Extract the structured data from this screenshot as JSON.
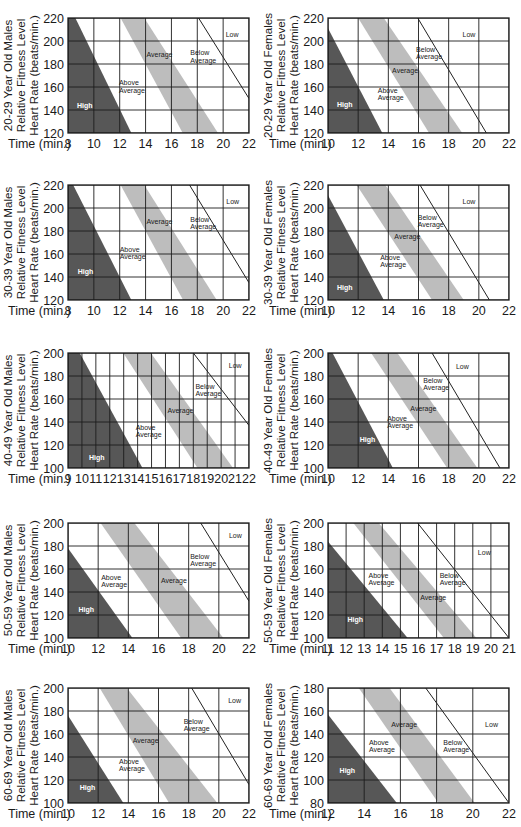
{
  "colors": {
    "high": "#575757",
    "average_band": "#bdbdbd",
    "grid": "#1c1c1c",
    "low_line": "#222222",
    "text": "#1a1a1a",
    "high_label": "#ffffff",
    "background": "#ffffff"
  },
  "chart_data": [
    {
      "id": "20-29-males",
      "type": "area",
      "title_lines": [
        "20-29 Year Old Males",
        "Relative Fitness Level",
        "Heart Rate (beats/min.)"
      ],
      "xlabel": "Time (min.)",
      "ylabel": "Heart Rate (beats/min.)",
      "xlim": [
        8,
        22
      ],
      "ylim": [
        120,
        220
      ],
      "x_ticks": [
        8,
        10,
        12,
        14,
        16,
        18,
        20,
        22
      ],
      "y_ticks": [
        120,
        140,
        160,
        180,
        200,
        220
      ],
      "grid": true,
      "high_region": [
        [
          8,
          220
        ],
        [
          8.57,
          220
        ],
        [
          12.9,
          120
        ],
        [
          8,
          120
        ]
      ],
      "average_band": [
        [
          12.07,
          220
        ],
        [
          13.9,
          220
        ],
        [
          19.6,
          120
        ],
        [
          16.87,
          120
        ]
      ],
      "low_line": [
        [
          18.1,
          220
        ],
        [
          22,
          150
        ]
      ],
      "labels": [
        {
          "lines": [
            "Low"
          ],
          "x": 20.2,
          "y": 206
        },
        {
          "lines": [
            "Below",
            "Average"
          ],
          "x": 17.46,
          "y": 189.6
        },
        {
          "lines": [
            "Average"
          ],
          "x": 14.07,
          "y": 188
        },
        {
          "lines": [
            "Above",
            "Average"
          ],
          "x": 11.94,
          "y": 163.5
        },
        {
          "lines": [
            "High"
          ],
          "x": 8.7,
          "y": 144,
          "on_dark": true
        }
      ]
    },
    {
      "id": "20-29-females",
      "type": "area",
      "title_lines": [
        "20-29 Year Old Females",
        "Relative Fitness Level",
        "Heart Rate (beats/min.)"
      ],
      "xlabel": "Time (min.)",
      "ylabel": "Heart Rate (beats/min.)",
      "xlim": [
        10,
        22
      ],
      "ylim": [
        120,
        220
      ],
      "x_ticks": [
        10,
        12,
        14,
        16,
        18,
        20,
        22
      ],
      "y_ticks": [
        120,
        140,
        160,
        180,
        200,
        220
      ],
      "grid": true,
      "high_region": [
        [
          10,
          211
        ],
        [
          13.6,
          120
        ],
        [
          10,
          120
        ]
      ],
      "average_band": [
        [
          12.0,
          220
        ],
        [
          13.7,
          220
        ],
        [
          18.9,
          120
        ],
        [
          16.7,
          120
        ]
      ],
      "low_line": [
        [
          15.95,
          220
        ],
        [
          20.5,
          120
        ]
      ],
      "labels": [
        {
          "lines": [
            "Low"
          ],
          "x": 18.92,
          "y": 206
        },
        {
          "lines": [
            "Below",
            "Average"
          ],
          "x": 15.84,
          "y": 192.5
        },
        {
          "lines": [
            "Average"
          ],
          "x": 14.25,
          "y": 174.5
        },
        {
          "lines": [
            "Above",
            "Average"
          ],
          "x": 13.3,
          "y": 157
        },
        {
          "lines": [
            "High"
          ],
          "x": 10.6,
          "y": 144.6,
          "on_dark": true
        }
      ]
    },
    {
      "id": "30-39-males",
      "type": "area",
      "title_lines": [
        "30-39 Year Old Males",
        "Relative Fitness Level",
        "Heart Rate (beats/min.)"
      ],
      "xlabel": "Time (min.)",
      "ylabel": "Heart Rate (beats/min.)",
      "xlim": [
        8,
        22
      ],
      "ylim": [
        120,
        220
      ],
      "x_ticks": [
        8,
        10,
        12,
        14,
        16,
        18,
        20,
        22
      ],
      "y_ticks": [
        120,
        140,
        160,
        180,
        200,
        220
      ],
      "grid": true,
      "high_region": [
        [
          8,
          220
        ],
        [
          8.4,
          220
        ],
        [
          12.9,
          120
        ],
        [
          8,
          120
        ]
      ],
      "average_band": [
        [
          12.07,
          220
        ],
        [
          13.9,
          220
        ],
        [
          19.5,
          120
        ],
        [
          16.9,
          120
        ]
      ],
      "low_line": [
        [
          17.4,
          220
        ],
        [
          22,
          135
        ]
      ],
      "labels": [
        {
          "lines": [
            "Low"
          ],
          "x": 20.24,
          "y": 206
        },
        {
          "lines": [
            "Below",
            "Average"
          ],
          "x": 17.46,
          "y": 190.4
        },
        {
          "lines": [
            "Average"
          ],
          "x": 14.07,
          "y": 188.4
        },
        {
          "lines": [
            "Above",
            "Average"
          ],
          "x": 12.0,
          "y": 164
        },
        {
          "lines": [
            "High"
          ],
          "x": 8.75,
          "y": 145,
          "on_dark": true
        }
      ]
    },
    {
      "id": "30-39-females",
      "type": "area",
      "title_lines": [
        "30-39 Year Old Females",
        "Relative Fitness Level",
        "Heart Rate (beats/min.)"
      ],
      "xlabel": "Time (min.)",
      "ylabel": "Heart Rate (beats/min.)",
      "xlim": [
        10,
        22
      ],
      "ylim": [
        120,
        220
      ],
      "x_ticks": [
        10,
        12,
        14,
        16,
        18,
        20,
        22
      ],
      "y_ticks": [
        120,
        140,
        160,
        180,
        200,
        220
      ],
      "grid": true,
      "high_region": [
        [
          10,
          211
        ],
        [
          13.7,
          120
        ],
        [
          10,
          120
        ]
      ],
      "average_band": [
        [
          11.9,
          220
        ],
        [
          13.8,
          220
        ],
        [
          19.0,
          120
        ],
        [
          16.9,
          120
        ]
      ],
      "low_line": [
        [
          16.1,
          220
        ],
        [
          20.7,
          120
        ]
      ],
      "labels": [
        {
          "lines": [
            "Low"
          ],
          "x": 18.92,
          "y": 206
        },
        {
          "lines": [
            "Below",
            "Average"
          ],
          "x": 15.95,
          "y": 191.6
        },
        {
          "lines": [
            "Average"
          ],
          "x": 14.4,
          "y": 175.6
        },
        {
          "lines": [
            "Above",
            "Average"
          ],
          "x": 13.46,
          "y": 157
        },
        {
          "lines": [
            "High"
          ],
          "x": 10.6,
          "y": 130.7,
          "on_dark": true
        }
      ]
    },
    {
      "id": "40-49-males",
      "type": "area",
      "title_lines": [
        "40-49 Year Old Males",
        "Relative Fitness Level",
        "Heart Rate (beats/min.)"
      ],
      "xlabel": "Time (min.)",
      "ylabel": "Heart Rate (beats/min.)",
      "xlim": [
        9,
        22
      ],
      "ylim": [
        100,
        200
      ],
      "x_ticks": [
        9,
        10,
        11,
        12,
        13,
        14,
        15,
        16,
        17,
        18,
        19,
        20,
        21,
        22
      ],
      "y_ticks": [
        100,
        120,
        140,
        160,
        180,
        200
      ],
      "grid": true,
      "high_region": [
        [
          9,
          200
        ],
        [
          9.84,
          200
        ],
        [
          14.35,
          100
        ],
        [
          9,
          100
        ]
      ],
      "average_band": [
        [
          12.97,
          200
        ],
        [
          14.95,
          200
        ],
        [
          20.85,
          100
        ],
        [
          18.3,
          100
        ]
      ],
      "low_line": [
        [
          18.0,
          200
        ],
        [
          22,
          137
        ]
      ],
      "labels": [
        {
          "lines": [
            "Low"
          ],
          "x": 20.55,
          "y": 189
        },
        {
          "lines": [
            "Below",
            "Average"
          ],
          "x": 18.15,
          "y": 170.8
        },
        {
          "lines": [
            "Average"
          ],
          "x": 16.15,
          "y": 150.4
        },
        {
          "lines": [
            "Above",
            "Average"
          ],
          "x": 13.86,
          "y": 135
        },
        {
          "lines": [
            "High"
          ],
          "x": 10.5,
          "y": 108.7,
          "on_dark": true
        }
      ]
    },
    {
      "id": "40-49-females",
      "type": "area",
      "title_lines": [
        "40-49 Year Old Females",
        "Relative Fitness Level",
        "Heart Rate (beats/min.)"
      ],
      "xlabel": "Time (min.)",
      "ylabel": "Heart Rate (beats/min.)",
      "xlim": [
        10,
        22
      ],
      "ylim": [
        100,
        200
      ],
      "x_ticks": [
        10,
        12,
        14,
        16,
        18,
        20,
        22
      ],
      "y_ticks": [
        100,
        120,
        140,
        160,
        180,
        200
      ],
      "grid": true,
      "high_region": [
        [
          10,
          200
        ],
        [
          10.3,
          200
        ],
        [
          14.3,
          100
        ],
        [
          10,
          100
        ]
      ],
      "average_band": [
        [
          12.86,
          200
        ],
        [
          14.6,
          200
        ],
        [
          19.9,
          100
        ],
        [
          17.9,
          100
        ]
      ],
      "low_line": [
        [
          16.9,
          200
        ],
        [
          21.4,
          100
        ]
      ],
      "labels": [
        {
          "lines": [
            "Low"
          ],
          "x": 18.48,
          "y": 188
        },
        {
          "lines": [
            "Below",
            "Average"
          ],
          "x": 16.32,
          "y": 176.5
        },
        {
          "lines": [
            "Average"
          ],
          "x": 15.46,
          "y": 152
        },
        {
          "lines": [
            "Above",
            "Average"
          ],
          "x": 13.92,
          "y": 143
        },
        {
          "lines": [
            "High"
          ],
          "x": 12.1,
          "y": 125,
          "on_dark": true
        }
      ]
    },
    {
      "id": "50-59-males",
      "type": "area",
      "title_lines": [
        "50-59 Year Old Males",
        "Relative Fitness Level",
        "Heart Rate (beats/min.)"
      ],
      "xlabel": "Time (min.)",
      "ylabel": "Heart Rate (beats/min.)",
      "xlim": [
        10,
        22
      ],
      "ylim": [
        100,
        200
      ],
      "x_ticks": [
        10,
        12,
        14,
        16,
        18,
        20,
        22
      ],
      "y_ticks": [
        100,
        120,
        140,
        160,
        180,
        200
      ],
      "grid": true,
      "high_region": [
        [
          10,
          178
        ],
        [
          14.27,
          100
        ],
        [
          10,
          100
        ]
      ],
      "average_band": [
        [
          12.16,
          200
        ],
        [
          14.4,
          200
        ],
        [
          20.3,
          100
        ],
        [
          17.5,
          100
        ]
      ],
      "low_line": [
        [
          18.8,
          200
        ],
        [
          22,
          132
        ]
      ],
      "labels": [
        {
          "lines": [
            "Low"
          ],
          "x": 20.67,
          "y": 189
        },
        {
          "lines": [
            "Below",
            "Average"
          ],
          "x": 18.1,
          "y": 171
        },
        {
          "lines": [
            "Average"
          ],
          "x": 16.16,
          "y": 150
        },
        {
          "lines": [
            "Above",
            "Average"
          ],
          "x": 12.2,
          "y": 153
        },
        {
          "lines": [
            "High"
          ],
          "x": 10.7,
          "y": 124.6,
          "on_dark": true
        }
      ]
    },
    {
      "id": "50-59-females",
      "type": "area",
      "title_lines": [
        "50-59 Year Old Females",
        "Relative Fitness Level",
        "Heart Rate (beats/min.)"
      ],
      "xlabel": "Time (min.)",
      "ylabel": "Heart Rate (beats/min.)",
      "xlim": [
        11,
        21
      ],
      "ylim": [
        100,
        200
      ],
      "x_ticks": [
        11,
        12,
        13,
        14,
        15,
        16,
        17,
        18,
        19,
        20,
        21
      ],
      "y_ticks": [
        100,
        120,
        140,
        160,
        180,
        200
      ],
      "grid": true,
      "high_region": [
        [
          11,
          184
        ],
        [
          15.4,
          100
        ],
        [
          11,
          100
        ]
      ],
      "average_band": [
        [
          12.4,
          200
        ],
        [
          13.8,
          200
        ],
        [
          19.2,
          100
        ],
        [
          17.4,
          100
        ]
      ],
      "low_line": [
        [
          15.95,
          200
        ],
        [
          21,
          100
        ]
      ],
      "labels": [
        {
          "lines": [
            "Low"
          ],
          "x": 19.28,
          "y": 174
        },
        {
          "lines": [
            "Below",
            "Average"
          ],
          "x": 17.17,
          "y": 154.5
        },
        {
          "lines": [
            "Average"
          ],
          "x": 16.1,
          "y": 135.6
        },
        {
          "lines": [
            "Above",
            "Average"
          ],
          "x": 13.24,
          "y": 154.5
        },
        {
          "lines": [
            "High"
          ],
          "x": 12.08,
          "y": 116.5,
          "on_dark": true
        }
      ]
    },
    {
      "id": "60-69-males",
      "type": "area",
      "title_lines": [
        "60-69 Year Old Males",
        "Relative Fitness Level",
        "Heart Rate (beats/min.)"
      ],
      "xlabel": "Time (min.)",
      "ylabel": "Heart Rate (beats/min.)",
      "xlim": [
        10,
        22
      ],
      "ylim": [
        100,
        200
      ],
      "x_ticks": [
        10,
        12,
        14,
        16,
        18,
        20,
        22
      ],
      "y_ticks": [
        100,
        120,
        140,
        160,
        180,
        200
      ],
      "grid": true,
      "high_region": [
        [
          10,
          176
        ],
        [
          13.67,
          100
        ],
        [
          10,
          100
        ]
      ],
      "average_band": [
        [
          12.1,
          200
        ],
        [
          13.9,
          200
        ],
        [
          19.9,
          100
        ],
        [
          16.7,
          100
        ]
      ],
      "low_line": [
        [
          18.2,
          200
        ],
        [
          22,
          116
        ]
      ],
      "labels": [
        {
          "lines": [
            "Low"
          ],
          "x": 20.62,
          "y": 189
        },
        {
          "lines": [
            "Below",
            "Average"
          ],
          "x": 17.67,
          "y": 170.8
        },
        {
          "lines": [
            "Average"
          ],
          "x": 14.29,
          "y": 154
        },
        {
          "lines": [
            "Above",
            "Average"
          ],
          "x": 13.38,
          "y": 136
        },
        {
          "lines": [
            "High"
          ],
          "x": 10.78,
          "y": 113.4,
          "on_dark": true
        }
      ]
    },
    {
      "id": "60-69-females",
      "type": "area",
      "title_lines": [
        "60-69 Year Old Females",
        "Relative Fitness Level",
        "Heart Rate (beats/min.)"
      ],
      "xlabel": "Time (min.)",
      "ylabel": "Heart Rate (beats/min.)",
      "xlim": [
        12,
        22
      ],
      "ylim": [
        80,
        180
      ],
      "x_ticks": [
        12,
        14,
        16,
        18,
        20,
        22
      ],
      "y_ticks": [
        80,
        100,
        120,
        140,
        160,
        180
      ],
      "grid": true,
      "high_region": [
        [
          12,
          157
        ],
        [
          15.8,
          80
        ],
        [
          12,
          80
        ]
      ],
      "average_band": [
        [
          13.7,
          180
        ],
        [
          15.4,
          180
        ],
        [
          20.1,
          80
        ],
        [
          18.1,
          80
        ]
      ],
      "low_line": [
        [
          17.4,
          180
        ],
        [
          22,
          80
        ]
      ],
      "labels": [
        {
          "lines": [
            "Low"
          ],
          "x": 20.68,
          "y": 148.5
        },
        {
          "lines": [
            "Below",
            "Average"
          ],
          "x": 18.37,
          "y": 133
        },
        {
          "lines": [
            "Average"
          ],
          "x": 15.49,
          "y": 148
        },
        {
          "lines": [
            "Above",
            "Average"
          ],
          "x": 14.26,
          "y": 133
        },
        {
          "lines": [
            "High"
          ],
          "x": 12.64,
          "y": 108.6,
          "on_dark": true
        }
      ]
    }
  ]
}
